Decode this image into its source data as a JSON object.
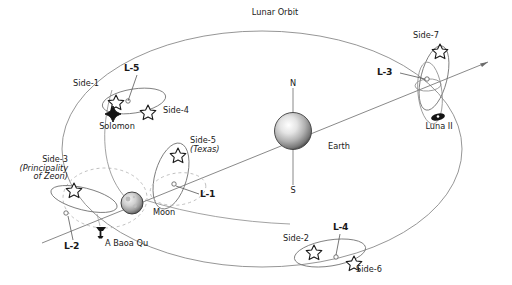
{
  "diagram": {
    "title_label": "Lunar Orbit",
    "bodies": [
      {
        "id": "earth",
        "label": "Earth",
        "type": "planet-sphere"
      },
      {
        "id": "moon",
        "label": "Moon",
        "type": "moon-sphere"
      },
      {
        "id": "luna2",
        "label": "Luna II",
        "type": "dark-ellipse-base"
      },
      {
        "id": "solomon",
        "label": "Solomon",
        "type": "dark-diamond-star"
      },
      {
        "id": "abaoaqu",
        "label": "A Baoa Qu",
        "type": "dark-fortress-icon"
      }
    ],
    "poles": {
      "north": "N",
      "south": "S"
    },
    "lagrange_points": [
      {
        "id": "L1",
        "label": "L-1"
      },
      {
        "id": "L2",
        "label": "L-2"
      },
      {
        "id": "L3",
        "label": "L-3"
      },
      {
        "id": "L4",
        "label": "L-4"
      },
      {
        "id": "L5",
        "label": "L-5"
      }
    ],
    "colonies": [
      {
        "id": "side1",
        "label": "Side-1",
        "sub": ""
      },
      {
        "id": "side2",
        "label": "Side-2",
        "sub": ""
      },
      {
        "id": "side3",
        "label": "Side-3",
        "sub": "(Principality",
        "sub2": "of Zeon)"
      },
      {
        "id": "side4",
        "label": "Side-4",
        "sub": ""
      },
      {
        "id": "side5",
        "label": "Side-5",
        "sub": "(Texas)"
      },
      {
        "id": "side6",
        "label": "Side-6",
        "sub": ""
      },
      {
        "id": "side7",
        "label": "Side-7",
        "sub": ""
      }
    ],
    "colors": {
      "ink": "#1a1a1a",
      "line": "#6b6b6b",
      "dashed": "#9a9a9a",
      "background": "#ffffff"
    }
  }
}
